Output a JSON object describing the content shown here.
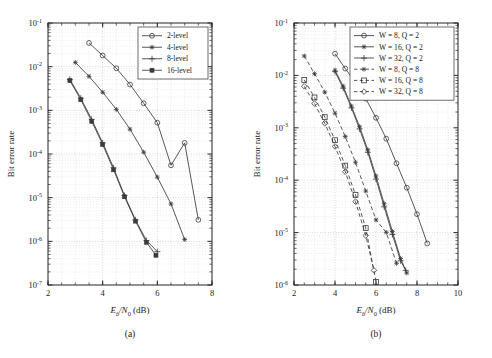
{
  "figure": {
    "background": "#ffffff",
    "line_color": "#3a3a3a",
    "grid_color": "#c8c8c8"
  },
  "panels": [
    {
      "id": "a",
      "caption": "(a)",
      "xlabel_main": "E",
      "xlabel_sub": "b",
      "xlabel_mid": "/N",
      "xlabel_sub2": "0",
      "xlabel_unit": " (dB)",
      "ylabel": "Bit error rate",
      "xticks": [
        "2",
        "4",
        "6",
        "8"
      ],
      "yticks": [
        "-1",
        "-2",
        "-3",
        "-4",
        "-5",
        "-6",
        "-7"
      ],
      "legend_title": "",
      "legend": [
        {
          "label": "2-level",
          "marker": "circle",
          "dash": "solid"
        },
        {
          "label": "4-level",
          "marker": "star",
          "dash": "solid"
        },
        {
          "label": "8-level",
          "marker": "plus",
          "dash": "solid"
        },
        {
          "label": "16-level",
          "marker": "square-filled",
          "dash": "solid"
        }
      ]
    },
    {
      "id": "b",
      "caption": "(b)",
      "xlabel_main": "E",
      "xlabel_sub": "b",
      "xlabel_mid": "/N",
      "xlabel_sub2": "0",
      "xlabel_unit": " (dB)",
      "ylabel": "Bit error rate",
      "xticks": [
        "2",
        "4",
        "6",
        "8",
        "10"
      ],
      "yticks": [
        "-1",
        "-2",
        "-3",
        "-4",
        "-5",
        "-6"
      ],
      "legend_title": "",
      "legend": [
        {
          "label": "W = 8, Q = 2",
          "marker": "circle",
          "dash": "solid"
        },
        {
          "label": "W = 16, Q = 2",
          "marker": "star",
          "dash": "solid"
        },
        {
          "label": "W = 32, Q = 2",
          "marker": "plus",
          "dash": "solid"
        },
        {
          "label": "W = 8, Q = 8",
          "marker": "star",
          "dash": "dashed"
        },
        {
          "label": "W = 16, Q = 8",
          "marker": "square",
          "dash": "dashed"
        },
        {
          "label": "W = 32, Q = 8",
          "marker": "diamond",
          "dash": "dashed"
        }
      ]
    }
  ],
  "chart_data": [
    {
      "type": "line",
      "panel": "a",
      "title": "(a) Bit error rate vs Eb/N0 for multi-level signalling",
      "xlabel": "Eb/N0 (dB)",
      "ylabel": "Bit error rate",
      "yscale": "log",
      "xlim": [
        2,
        8
      ],
      "ylim": [
        1e-07,
        0.1
      ],
      "grid": true,
      "legend_position": "upper-right",
      "series": [
        {
          "name": "2-level",
          "marker": "circle",
          "dash": "solid",
          "x": [
            3.5,
            4.0,
            4.5,
            5.0,
            5.5,
            6.0,
            6.5,
            7.0,
            7.5
          ],
          "y": [
            0.035,
            0.018,
            0.0092,
            0.0039,
            0.00145,
            0.00052,
            5.5e-05,
            0.00018,
            3.1e-06
          ]
        },
        {
          "name": "4-level",
          "marker": "star",
          "dash": "solid",
          "x": [
            3.0,
            3.5,
            4.0,
            4.5,
            5.0,
            5.5,
            6.0,
            6.5,
            7.0
          ],
          "y": [
            0.0125,
            0.006,
            0.0026,
            0.00105,
            0.00037,
            0.00011,
            2.95e-05,
            7.2e-06,
            1.1e-06
          ]
        },
        {
          "name": "8-level",
          "marker": "plus",
          "dash": "solid",
          "x": [
            2.8,
            3.2,
            3.6,
            4.0,
            4.4,
            4.8,
            5.2,
            5.6,
            6.0
          ],
          "y": [
            0.0051,
            0.0019,
            0.00062,
            0.00018,
            4.8e-05,
            1.12e-05,
            3.1e-06,
            1.05e-06,
            5.8e-07
          ]
        },
        {
          "name": "16-level",
          "marker": "square-filled",
          "dash": "solid",
          "x": [
            2.8,
            3.2,
            3.6,
            4.0,
            4.4,
            4.8,
            5.2,
            5.6,
            5.95
          ],
          "y": [
            0.0048,
            0.00175,
            0.00056,
            0.000165,
            4.35e-05,
            1.05e-05,
            2.9e-06,
            9.5e-07,
            4.8e-07
          ]
        }
      ]
    },
    {
      "type": "line",
      "panel": "b",
      "title": "(b) Bit error rate vs Eb/N0 for window size W and quantisation Q",
      "xlabel": "Eb/N0 (dB)",
      "ylabel": "Bit error rate",
      "yscale": "log",
      "xlim": [
        2,
        10
      ],
      "ylim": [
        1e-06,
        0.1
      ],
      "grid": true,
      "legend_position": "upper-right",
      "series": [
        {
          "name": "W = 8, Q = 2",
          "marker": "circle",
          "dash": "solid",
          "x": [
            4.0,
            4.5,
            5.0,
            5.5,
            6.0,
            6.5,
            7.0,
            7.5,
            8.0,
            8.5
          ],
          "y": [
            0.026,
            0.0135,
            0.0073,
            0.0036,
            0.00155,
            0.00062,
            0.00021,
            7.2e-05,
            2.25e-05,
            6.2e-06
          ]
        },
        {
          "name": "W = 16, Q = 2",
          "marker": "star",
          "dash": "solid",
          "x": [
            4.0,
            4.4,
            4.8,
            5.2,
            5.6,
            6.0,
            6.4,
            6.8,
            7.2,
            7.5
          ],
          "y": [
            0.0125,
            0.0062,
            0.0026,
            0.00105,
            0.00038,
            0.00012,
            3.55e-05,
            1.05e-05,
            3.2e-06,
            1.7e-06
          ]
        },
        {
          "name": "W = 32, Q = 2",
          "marker": "plus",
          "dash": "solid",
          "x": [
            4.0,
            4.4,
            4.8,
            5.2,
            5.6,
            6.0,
            6.4,
            6.8,
            7.2,
            7.45
          ],
          "y": [
            0.0118,
            0.0057,
            0.0024,
            0.00095,
            0.00034,
            0.000105,
            3.1e-05,
            9.2e-06,
            2.9e-06,
            1.9e-06
          ]
        },
        {
          "name": "W = 8, Q = 8",
          "marker": "star",
          "dash": "dashed",
          "x": [
            2.5,
            3.0,
            3.5,
            4.0,
            4.5,
            5.0,
            5.5,
            6.0,
            6.5,
            7.0
          ],
          "y": [
            0.0235,
            0.0108,
            0.0048,
            0.0019,
            0.00068,
            0.00022,
            6.2e-05,
            1.75e-05,
            1.01e-05,
            2.6e-06
          ]
        },
        {
          "name": "W = 16, Q = 8",
          "marker": "square",
          "dash": "dashed",
          "x": [
            2.5,
            3.0,
            3.5,
            4.0,
            4.5,
            5.0,
            5.5,
            6.0
          ],
          "y": [
            0.0082,
            0.0038,
            0.0016,
            0.00058,
            0.00019,
            5.25e-05,
            1.22e-05,
            1.15e-06
          ]
        },
        {
          "name": "W = 32, Q = 8",
          "marker": "diamond",
          "dash": "dashed",
          "x": [
            2.5,
            3.0,
            3.5,
            4.0,
            4.5,
            5.0,
            5.5,
            5.9
          ],
          "y": [
            0.0062,
            0.0029,
            0.00122,
            0.00044,
            0.000145,
            3.9e-05,
            8.8e-06,
            1.9e-06
          ]
        }
      ]
    }
  ]
}
